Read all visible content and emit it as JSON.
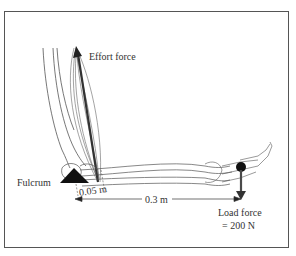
{
  "diagram": {
    "labels": {
      "effort": "Effort force",
      "fulcrum": "Fulcrum",
      "effort_arm": "0.05 m",
      "load_arm": "0.3 m",
      "load_line1": "Load force",
      "load_line2": "= 200 N"
    },
    "colors": {
      "frame": "#555555",
      "line": "#444444",
      "fulcrum": "#111111",
      "effort_arrow": "#333333",
      "load_arrow": "#4a4a4a"
    }
  }
}
